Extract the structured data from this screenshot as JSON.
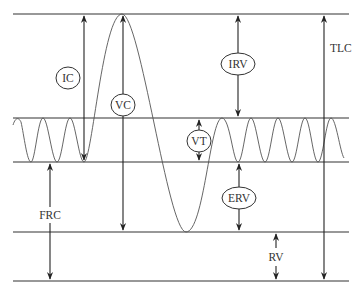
{
  "diagram": {
    "colors": {
      "line": "#333333",
      "wave": "#555555",
      "background": "#ffffff"
    },
    "levels": [
      {
        "name": "TLC level",
        "y": 14
      },
      {
        "name": "End-inspiratory level",
        "y": 118
      },
      {
        "name": "End-expiratory level (FRC)",
        "y": 162
      },
      {
        "name": "RV level",
        "y": 232
      },
      {
        "name": "Zero volume",
        "y": 281
      }
    ],
    "labels": {
      "ic": "IC",
      "vc": "VC",
      "irv": "IRV",
      "tlc": "TLC",
      "vt": "VT",
      "frc": "FRC",
      "erv": "ERV",
      "rv": "RV"
    },
    "label_meanings": {
      "IC": "Inspiratory capacity",
      "VC": "Vital capacity",
      "IRV": "Inspiratory reserve volume",
      "TLC": "Total lung capacity",
      "VT": "Tidal volume",
      "FRC": "Functional residual capacity",
      "ERV": "Expiratory reserve volume",
      "RV": "Residual volume"
    }
  }
}
